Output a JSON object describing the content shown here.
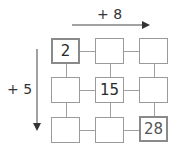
{
  "top_operator": {
    "label": "+ 8",
    "direction": "right"
  },
  "left_operator": {
    "label": "+ 5",
    "direction": "down"
  },
  "grid": {
    "rows": 3,
    "cols": 3,
    "cells": [
      [
        "2",
        "",
        ""
      ],
      [
        "",
        "15",
        ""
      ],
      [
        "",
        "",
        "28"
      ]
    ]
  },
  "colors": {
    "stroke": "#9a9a9a",
    "text": "#2a2a2a",
    "arrow": "#333333"
  }
}
